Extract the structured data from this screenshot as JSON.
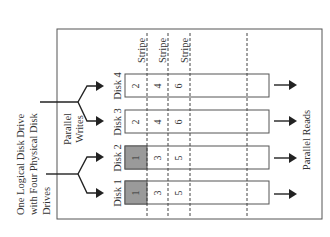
{
  "diagram": {
    "title_lines": [
      "One Logical Disk Drive",
      "with Four Physical Disk",
      "Drives"
    ],
    "writes_label_lines": [
      "Parallel",
      "Writes"
    ],
    "reads_label": "Parallel Reads",
    "stripe_label": "Stripe",
    "stripes": [
      "Stripe",
      "Stripe",
      "Stripe"
    ],
    "shade_color": "#9a9a9a",
    "disks": [
      {
        "label": "Disk 4",
        "cells": [
          "2",
          "4",
          "6"
        ],
        "first_shaded": false
      },
      {
        "label": "Disk 3",
        "cells": [
          "2",
          "4",
          "6"
        ],
        "first_shaded": false
      },
      {
        "label": "Disk 2",
        "cells": [
          "1",
          "3",
          "5"
        ],
        "first_shaded": true
      },
      {
        "label": "Disk 1",
        "cells": [
          "1",
          "3",
          "5"
        ],
        "first_shaded": true
      }
    ]
  }
}
